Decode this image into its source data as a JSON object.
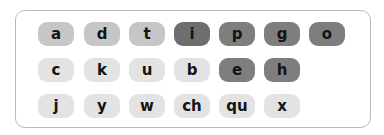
{
  "rows": [
    [
      {
        "label": "a",
        "shade": "medium"
      },
      {
        "label": "d",
        "shade": "medium"
      },
      {
        "label": "t",
        "shade": "medium"
      },
      {
        "label": "i",
        "shade": "darker"
      },
      {
        "label": "p",
        "shade": "dark"
      },
      {
        "label": "g",
        "shade": "dark"
      },
      {
        "label": "o",
        "shade": "dark"
      }
    ],
    [
      {
        "label": "c",
        "shade": "light"
      },
      {
        "label": "k",
        "shade": "light"
      },
      {
        "label": "u",
        "shade": "light"
      },
      {
        "label": "b",
        "shade": "light"
      },
      {
        "label": "e",
        "shade": "dark"
      },
      {
        "label": "h",
        "shade": "dark"
      }
    ],
    [
      {
        "label": "j",
        "shade": "light"
      },
      {
        "label": "y",
        "shade": "light"
      },
      {
        "label": "w",
        "shade": "light"
      },
      {
        "label": "ch",
        "shade": "light"
      },
      {
        "label": "qu",
        "shade": "light"
      },
      {
        "label": "x",
        "shade": "light"
      }
    ]
  ],
  "colors": {
    "light": "#e3e3e3",
    "medium": "#c6c6c6",
    "dark": "#7e7e7e",
    "darker": "#6e6e6e",
    "frame_border": "#b9b9b9",
    "text": "#141414"
  }
}
